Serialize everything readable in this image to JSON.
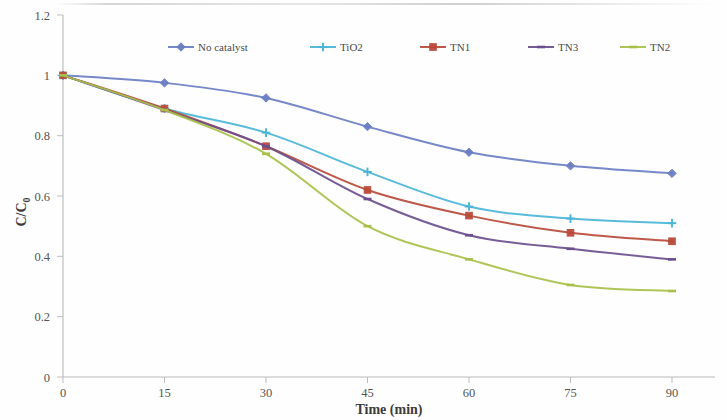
{
  "chart_data": {
    "type": "line",
    "title": "",
    "xlabel": "Time (min)",
    "ylabel": "C/C₀",
    "ylabel_main": "C/C",
    "ylabel_sub": "0",
    "x": [
      0,
      15,
      30,
      45,
      60,
      75,
      90
    ],
    "xlim": [
      0,
      97
    ],
    "ylim": [
      0,
      1.2
    ],
    "xticks": [
      "0",
      "15",
      "30",
      "45",
      "60",
      "75",
      "90"
    ],
    "yticks": [
      "0",
      "0.2",
      "0.4",
      "0.6",
      "0.8",
      "1",
      "1.2"
    ],
    "ytick_values": [
      0,
      0.2,
      0.4,
      0.6,
      0.8,
      1,
      1.2
    ],
    "grid": false,
    "legend_position": "top-center",
    "series": [
      {
        "name": "No catalyst",
        "color": "#6b7ec4",
        "marker": "diamond",
        "values": [
          1.0,
          0.975,
          0.925,
          0.83,
          0.745,
          0.7,
          0.675
        ]
      },
      {
        "name": "TiO2",
        "color": "#4bb5d8",
        "marker": "plus",
        "values": [
          1.0,
          0.89,
          0.81,
          0.68,
          0.565,
          0.525,
          0.51
        ]
      },
      {
        "name": "TN1",
        "color": "#b94a3a",
        "marker": "square",
        "values": [
          1.0,
          0.89,
          0.765,
          0.62,
          0.535,
          0.478,
          0.45
        ]
      },
      {
        "name": "TN3",
        "color": "#6b4e8e",
        "marker": "dash",
        "values": [
          1.0,
          0.885,
          0.765,
          0.59,
          0.47,
          0.425,
          0.39
        ]
      },
      {
        "name": "TN2",
        "color": "#a8c04a",
        "marker": "dash",
        "values": [
          1.0,
          0.885,
          0.74,
          0.5,
          0.39,
          0.305,
          0.285
        ]
      }
    ]
  },
  "legend": {
    "entries": [
      {
        "label": "No catalyst",
        "color": "#6b7ec4"
      },
      {
        "label": "TiO2",
        "color": "#4bb5d8"
      },
      {
        "label": "TN1",
        "color": "#b94a3a"
      },
      {
        "label": "TN3",
        "color": "#6b4e8e"
      },
      {
        "label": "TN2",
        "color": "#a8c04a"
      }
    ]
  },
  "axes": {
    "x_title": "Time (min)",
    "y_title": "C/C₀"
  }
}
